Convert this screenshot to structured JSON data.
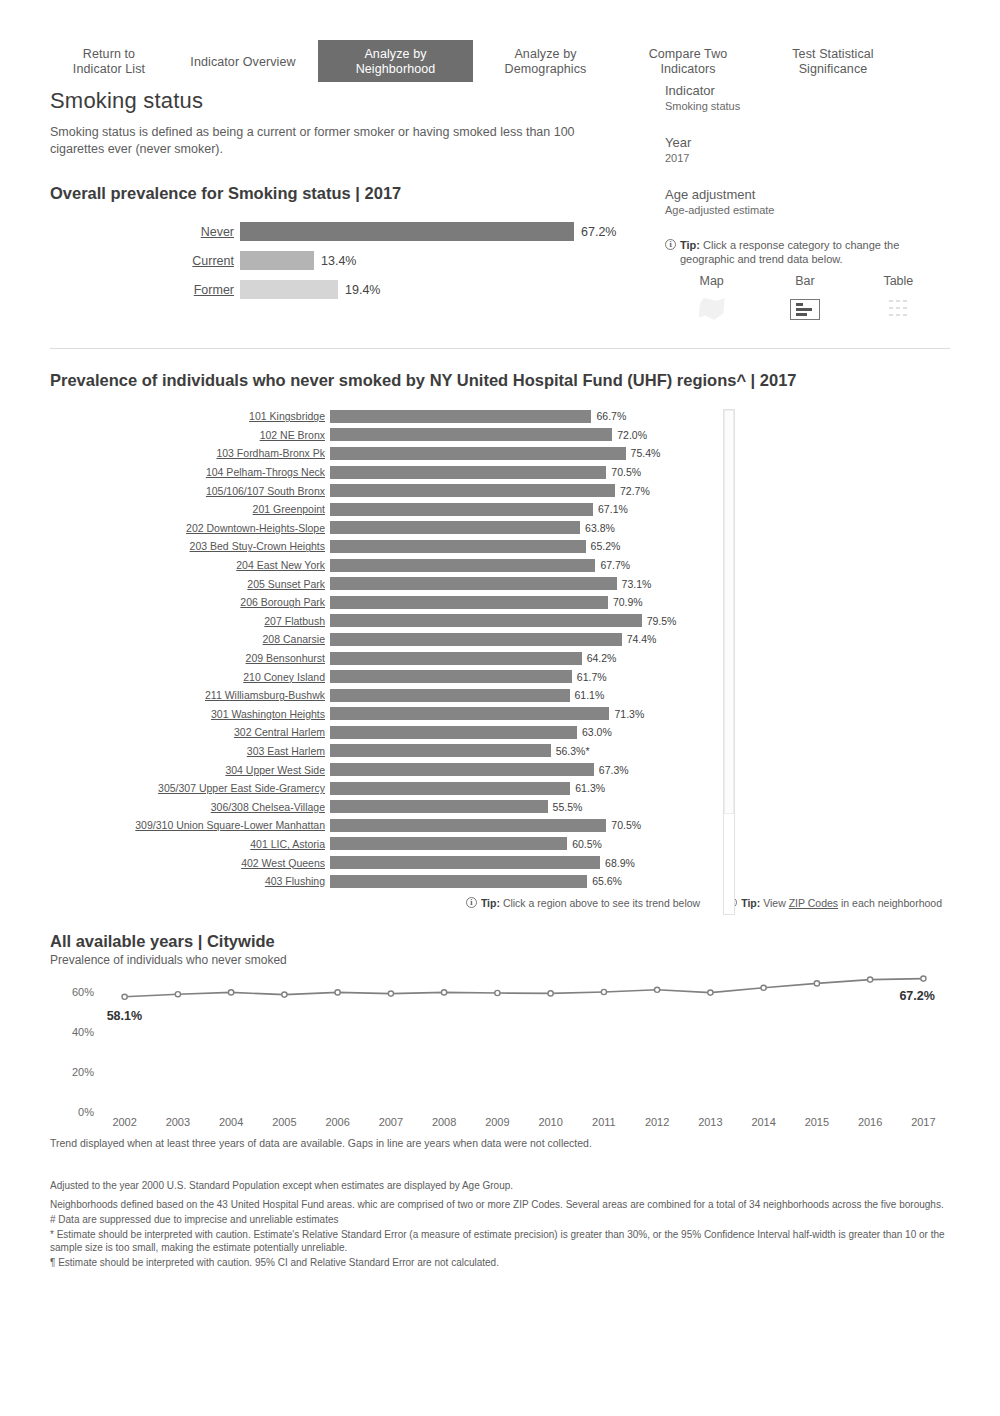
{
  "tabs": [
    {
      "label": "Return to\nIndicator List",
      "active": false,
      "width": "w1"
    },
    {
      "label": "Indicator Overview",
      "active": false,
      "width": "w2"
    },
    {
      "label": "Analyze by\nNeighborhood",
      "active": true,
      "width": "w3"
    },
    {
      "label": "Analyze by\nDemographics",
      "active": false,
      "width": "w4"
    },
    {
      "label": "Compare Two\nIndicators",
      "active": false,
      "width": "w5"
    },
    {
      "label": "Test Statistical\nSignificance",
      "active": false,
      "width": "w6"
    }
  ],
  "header": {
    "title": "Smoking status",
    "description": "Smoking status is defined as being a current or former smoker or having smoked less than 100 cigarettes ever (never smoker)."
  },
  "meta": {
    "indicator_label": "Indicator",
    "indicator_value": "Smoking status",
    "year_label": "Year",
    "year_value": "2017",
    "age_label": "Age adjustment",
    "age_value": "Age-adjusted estimate"
  },
  "overall": {
    "title": "Overall prevalence for Smoking status | 2017",
    "categories": [
      {
        "label": "Never",
        "value": "67.2%",
        "pct": 67.2,
        "selected": true
      },
      {
        "label": "Current",
        "value": "13.4%",
        "pct": 13.4,
        "selected": false
      },
      {
        "label": "Former",
        "value": "19.4%",
        "pct": 19.4,
        "selected": false
      }
    ]
  },
  "tip_category": {
    "prefix": "Tip:",
    "text": "Click a response category to change the geographic and trend data below."
  },
  "views": {
    "map_label": "Map",
    "bar_label": "Bar",
    "table_label": "Table",
    "selected": "Bar"
  },
  "uhf": {
    "title": "Prevalence of individuals who never smoked  by NY United Hospital Fund (UHF) regions^ | 2017",
    "tip_region": {
      "prefix": "Tip:",
      "text": "Click a region above to see its trend below"
    },
    "tip_zip": {
      "prefix": "Tip:",
      "pre": "View",
      "link": "ZIP Codes",
      "post": "in each neighborhood"
    }
  },
  "trend": {
    "title": "All available years | Citywide",
    "subtitle": "Prevalence of individuals who never smoked",
    "start_label": "58.1%",
    "end_label": "67.2%",
    "note": "Trend displayed when at least three years of data are available. Gaps in line are years when data were not collected."
  },
  "footnotes": [
    "Adjusted to the year 2000 U.S. Standard Population except when estimates are displayed by Age Group.",
    "Neighborhoods defined based on the 43 United Hospital Fund areas. whic are comprised of two or more ZIP Codes. Several areas are combined for a total of 34 neighborhoods across the five boroughs.",
    "# Data are suppressed due to imprecise and unreliable estimates",
    "* Estimate should be interpreted with caution. Estimate's Relative Standard Error (a measure of estimate precision) is greater than 30%, or the 95% Confidence Interval half-width is greater than 10 or the sample size is too small, making the estimate potentially unreliable.",
    "¶ Estimate should be interpreted with caution. 95% CI and Relative Standard Error are not calculated."
  ],
  "colors": {
    "bar_dark": "#858585",
    "bar_overall": "#7b7b7b",
    "active_tab": "#6e6e6e",
    "line": "#808080"
  },
  "chart_data": [
    {
      "type": "bar",
      "title": "Overall prevalence for Smoking status | 2017",
      "orientation": "horizontal",
      "categories": [
        "Never",
        "Current",
        "Former"
      ],
      "values": [
        67.2,
        13.4,
        19.4
      ],
      "value_labels": [
        "67.2%",
        "13.4%",
        "19.4%"
      ],
      "xlabel": "",
      "ylabel": "",
      "xlim": [
        0,
        100
      ],
      "grid": false,
      "legend": false
    },
    {
      "type": "bar",
      "title": "Prevalence of individuals who never smoked  by NY United Hospital Fund (UHF) regions^ | 2017",
      "orientation": "horizontal",
      "xlabel": "",
      "ylabel": "",
      "xlim": [
        0,
        85
      ],
      "grid": false,
      "legend": false,
      "categories": [
        "101 Kingsbridge",
        "102 NE Bronx",
        "103 Fordham-Bronx Pk",
        "104 Pelham-Throgs Neck",
        "105/106/107 South Bronx",
        "201 Greenpoint",
        "202 Downtown-Heights-Slope",
        "203 Bed Stuy-Crown Heights",
        "204 East New York",
        "205 Sunset Park",
        "206 Borough Park",
        "207 Flatbush",
        "208 Canarsie",
        "209 Bensonhurst",
        "210 Coney Island",
        "211 Williamsburg-Bushwk",
        "301 Washington Heights",
        "302 Central Harlem",
        "303 East Harlem",
        "304 Upper West Side",
        "305/307 Upper East Side-Gramercy",
        "306/308 Chelsea-Village",
        "309/310 Union Square-Lower Manhattan",
        "401 LIC, Astoria",
        "402 West Queens",
        "403 Flushing"
      ],
      "values": [
        66.7,
        72.0,
        75.4,
        70.5,
        72.7,
        67.1,
        63.8,
        65.2,
        67.7,
        73.1,
        70.9,
        79.5,
        74.4,
        64.2,
        61.7,
        61.1,
        71.3,
        63.0,
        56.3,
        67.3,
        61.3,
        55.5,
        70.5,
        60.5,
        68.9,
        65.6
      ],
      "value_labels": [
        "66.7%",
        "72.0%",
        "75.4%",
        "70.5%",
        "72.7%",
        "67.1%",
        "63.8%",
        "65.2%",
        "67.7%",
        "73.1%",
        "70.9%",
        "79.5%",
        "74.4%",
        "64.2%",
        "61.7%",
        "61.1%",
        "71.3%",
        "63.0%",
        "56.3%*",
        "67.3%",
        "61.3%",
        "55.5%",
        "70.5%",
        "60.5%",
        "68.9%",
        "65.6%"
      ]
    },
    {
      "type": "line",
      "title": "All available years | Citywide",
      "subtitle": "Prevalence of individuals who never smoked",
      "x": [
        2002,
        2003,
        2004,
        2005,
        2006,
        2007,
        2008,
        2009,
        2010,
        2011,
        2012,
        2013,
        2014,
        2015,
        2016,
        2017
      ],
      "values": [
        58.1,
        59.4,
        60.3,
        59.2,
        60.3,
        59.7,
        60.3,
        60.0,
        59.8,
        60.5,
        61.6,
        60.2,
        62.6,
        64.8,
        66.7,
        67.2
      ],
      "xlabel": "",
      "ylabel": "",
      "ylim": [
        0,
        70
      ],
      "yticks": [
        "0%",
        "20%",
        "40%",
        "60%"
      ],
      "xticks": [
        "2002",
        "2003",
        "2004",
        "2005",
        "2006",
        "2007",
        "2008",
        "2009",
        "2010",
        "2011",
        "2012",
        "2013",
        "2014",
        "2015",
        "2016",
        "2017"
      ],
      "grid": false,
      "legend": false,
      "annotations": [
        {
          "text": "58.1%",
          "at": 2002
        },
        {
          "text": "67.2%",
          "at": 2017
        }
      ]
    }
  ]
}
